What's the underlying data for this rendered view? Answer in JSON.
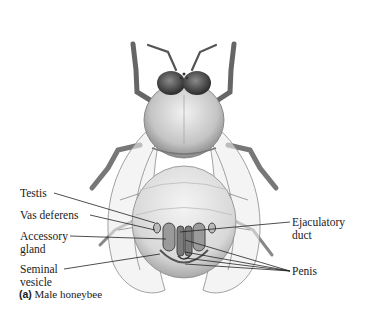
{
  "figure": {
    "caption": {
      "panel": "(a)",
      "text": "Male honeybee"
    },
    "labels": {
      "testis": "Testis",
      "vas_deferens": "Vas deferens",
      "accessory_gland_1": "Accessory",
      "accessory_gland_2": "gland",
      "seminal_vesicle_1": "Seminal",
      "seminal_vesicle_2": "vesicle",
      "ejaculatory_duct_1": "Ejaculatory",
      "ejaculatory_duct_2": "duct",
      "penis": "Penis"
    },
    "colors": {
      "ink": "#1a1a1a",
      "body_gray": "#9a9a9a",
      "wing": "#e8e8e8",
      "background": "#ffffff"
    }
  }
}
